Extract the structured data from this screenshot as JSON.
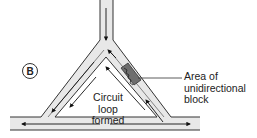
{
  "panel_label": "B",
  "annotations": {
    "block_area_line1": "Area of",
    "block_area_line2": "unidirectional",
    "block_area_line3": "block",
    "loop_line1": "Circuit",
    "loop_line2": "loop formed"
  },
  "colors": {
    "vessel_fill": "#e8e8e8",
    "vessel_outline": "#333333",
    "block_fill": "#6e6e6e",
    "arrow": "#111111",
    "text": "#222222"
  },
  "elements": {
    "vessels": [
      "incoming-vertical-vessel",
      "left-branch",
      "right-branch",
      "bottom-horizontal-vessel"
    ],
    "arrows": [
      "down-flow-top",
      "down-left-branch-flow",
      "up-right-branch-flow",
      "left-bottom-flow",
      "right-bottom-flow",
      "inner-loop-up-arrow",
      "inner-loop-down-arrow",
      "apex-return-arrow"
    ]
  }
}
